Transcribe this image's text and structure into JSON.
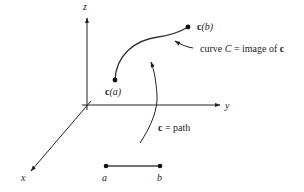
{
  "axes": {
    "x_label": "x",
    "y_label": "y",
    "z_label": "z"
  },
  "curve": {
    "start_label_bold": "c",
    "start_label_arg": "(a)",
    "end_label_bold": "c",
    "end_label_arg": "(b)",
    "annotation_prefix": "curve ",
    "annotation_var": "C",
    "annotation_mid": " = image of ",
    "annotation_bold": "c"
  },
  "path": {
    "label_bold": "c",
    "label_rest": " = path"
  },
  "interval": {
    "a_label": "a",
    "b_label": "b"
  },
  "colors": {
    "ink": "#222222",
    "background": "#ffffff"
  }
}
